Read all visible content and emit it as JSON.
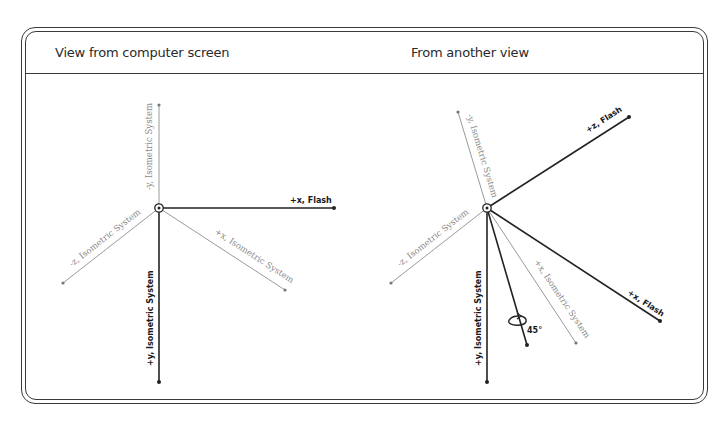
{
  "panels": {
    "left": {
      "title": "View from computer screen",
      "origin": [
        159,
        208
      ],
      "axes": [
        {
          "id": "neg-y-iso",
          "label": "-y, Isometric System",
          "end": [
            159,
            105
          ],
          "style": "light"
        },
        {
          "id": "pos-x-flash",
          "label": "+x, Flash",
          "end": [
            334,
            208
          ],
          "style": "dark"
        },
        {
          "id": "pos-x-iso",
          "label": "+x, Isometric System",
          "end": [
            285,
            290
          ],
          "style": "light"
        },
        {
          "id": "neg-z-iso",
          "label": "-z, Isometric System",
          "end": [
            63,
            283
          ],
          "style": "light"
        },
        {
          "id": "pos-y-iso",
          "label": "+y, Isometric System",
          "end": [
            159,
            382
          ],
          "style": "dark"
        }
      ]
    },
    "right": {
      "title": "From another view",
      "origin": [
        487,
        208
      ],
      "axes": [
        {
          "id": "neg-y-iso",
          "label": "-y, Isometric System",
          "end": [
            458,
            112
          ],
          "style": "light"
        },
        {
          "id": "pos-z-flash",
          "label": "+z, Flash",
          "end": [
            629,
            117
          ],
          "style": "dark"
        },
        {
          "id": "pos-x-flash",
          "label": "+x, Flash",
          "end": [
            660,
            321
          ],
          "style": "dark"
        },
        {
          "id": "pos-x-iso",
          "label": "+x, Isometric System",
          "end": [
            576,
            343
          ],
          "style": "light"
        },
        {
          "id": "rotated-axis",
          "label": "",
          "end": [
            527,
            345
          ],
          "style": "dark"
        },
        {
          "id": "neg-z-iso",
          "label": "-z, Isometric System",
          "end": [
            391,
            283
          ],
          "style": "light"
        },
        {
          "id": "pos-y-iso",
          "label": "+y, Isometric System",
          "end": [
            487,
            382
          ],
          "style": "dark"
        }
      ],
      "rotation_label": "45°"
    }
  }
}
